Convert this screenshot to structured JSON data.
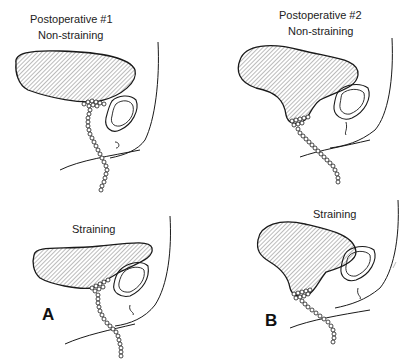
{
  "figure": {
    "panels": [
      {
        "id": "A",
        "title": "Postoperative #1",
        "views": [
          {
            "label": "Non-straining"
          },
          {
            "label": "Straining"
          }
        ],
        "letter": "A"
      },
      {
        "id": "B",
        "title": "Postoperative #2",
        "views": [
          {
            "label": "Non-straining"
          },
          {
            "label": "Straining"
          }
        ],
        "letter": "B"
      }
    ],
    "colors": {
      "line": "#1a1a1a",
      "hatch": "#555555",
      "background": "#ffffff"
    }
  }
}
